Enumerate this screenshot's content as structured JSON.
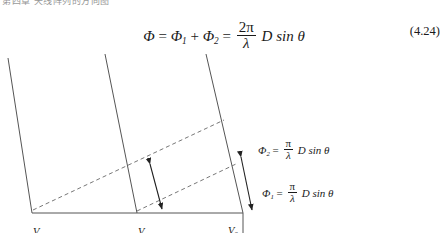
{
  "page": {
    "header_fragment": "第四章 天线阵列的方向图",
    "background_color": "#ffffff",
    "ink_color": "#1a1a1a"
  },
  "equation": {
    "number": "(4.24)",
    "lhs": "Φ",
    "equals": "=",
    "term1": "Φ",
    "term1_sub": "1",
    "plus": "+",
    "term2": "Φ",
    "term2_sub": "2",
    "equals2": "=",
    "fraction_numerator": "2π",
    "fraction_denominator": "λ",
    "tail": "D sin θ",
    "plain_text": "Φ = Φ1 + Φ2 = (2π/λ) D sin θ"
  },
  "figure": {
    "annotations": [
      {
        "id": "phi2",
        "symbol": "Φ",
        "subscript": "2",
        "equals": "=",
        "numerator": "π",
        "denominator": "λ",
        "tail": "D sin θ",
        "plain_text": "Φ2 = (π/λ) D sin θ"
      },
      {
        "id": "phi1",
        "symbol": "Φ",
        "subscript": "1",
        "equals": "=",
        "numerator": "π",
        "denominator": "λ",
        "tail": "D sin θ",
        "plain_text": "Φ1 = (π/λ) D sin θ"
      }
    ],
    "element_labels": [
      {
        "id": "v1",
        "symbol": "V",
        "subscript": "1"
      },
      {
        "id": "v2",
        "symbol": "V",
        "subscript": "2"
      },
      {
        "id": "v3",
        "symbol": "V",
        "subscript": "3"
      }
    ],
    "dimension_label": {
      "symbol": "D"
    },
    "line_color": "#555555",
    "dash_color": "#777777",
    "arrow_color": "#222222"
  }
}
